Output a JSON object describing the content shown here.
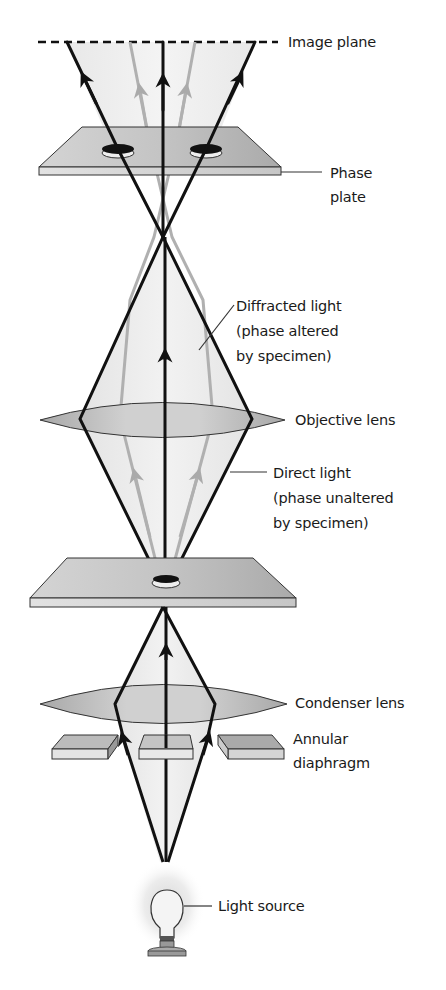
{
  "labels": {
    "image_plane": "Image plane",
    "phase_plate": [
      "Phase",
      "plate"
    ],
    "diffracted_light": [
      "Diffracted light",
      "(phase altered",
      "by specimen)"
    ],
    "objective_lens": "Objective lens",
    "direct_light": [
      "Direct light",
      "(phase unaltered",
      "by specimen)"
    ],
    "condenser_lens": "Condenser lens",
    "annular_diaphragm": [
      "Annular",
      "diaphragm"
    ],
    "light_source": "Light source"
  },
  "colors": {
    "direct_ray": "#111111",
    "diffracted_ray": "#b0b0b0",
    "lens_fill": "#bdbdbd",
    "plate_fill": "#c8c8c8",
    "cone_fill": "#e6e6e6"
  }
}
